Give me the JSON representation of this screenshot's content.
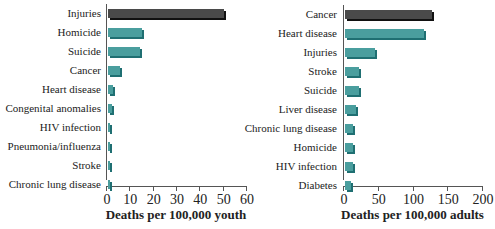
{
  "chart_data": [
    {
      "type": "bar",
      "orientation": "horizontal",
      "title": "",
      "xlabel": "Deaths per 100,000 youth",
      "ylabel": "",
      "xlim": [
        0,
        60
      ],
      "xticks": [
        0,
        10,
        20,
        30,
        40,
        50,
        60
      ],
      "categories": [
        "Injuries",
        "Homicide",
        "Suicide",
        "Cancer",
        "Heart disease",
        "Congenital anomalies",
        "HIV infection",
        "Pneumonia/influenza",
        "Stroke",
        "Chronic lung disease"
      ],
      "values": [
        50.5,
        15.5,
        14.5,
        6,
        3,
        2.5,
        1.5,
        1.5,
        1.5,
        1.3
      ],
      "highlight_index": 0,
      "colors": {
        "highlight": "#4a4a4a",
        "highlight_shadow": "#111111",
        "bar": "#4a9e9e",
        "bar_shadow": "#1f6f72"
      },
      "grid": false
    },
    {
      "type": "bar",
      "orientation": "horizontal",
      "title": "",
      "xlabel": "Deaths per 100,000 adults",
      "ylabel": "",
      "xlim": [
        0,
        200
      ],
      "xticks": [
        0,
        50,
        100,
        150,
        200
      ],
      "categories": [
        "Cancer",
        "Heart disease",
        "Injuries",
        "Stroke",
        "Suicide",
        "Liver disease",
        "Chronic lung disease",
        "Homicide",
        "HIV infection",
        "Diabetes"
      ],
      "values": [
        128,
        117,
        46,
        23,
        23,
        19,
        15,
        15,
        14,
        11
      ],
      "highlight_index": 0,
      "colors": {
        "highlight": "#4a4a4a",
        "highlight_shadow": "#111111",
        "bar": "#4a9e9e",
        "bar_shadow": "#1f6f72"
      },
      "grid": false
    }
  ],
  "caption": "leading causes of death for youth and adults (partially visible)"
}
